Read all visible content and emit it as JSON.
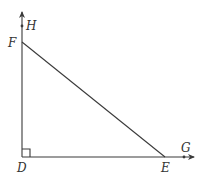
{
  "diagram": {
    "type": "geometry",
    "colors": {
      "line": "#3a3a3a",
      "label": "#333333",
      "background": "#ffffff"
    },
    "points": {
      "D": {
        "label": "D",
        "x": 22,
        "y": 157
      },
      "E": {
        "label": "E",
        "x": 165,
        "y": 157
      },
      "F": {
        "label": "F",
        "x": 22,
        "y": 42
      },
      "G": {
        "label": "G",
        "x": 184,
        "y": 157
      },
      "H": {
        "label": "H",
        "x": 22,
        "y": 26
      }
    },
    "segments": [
      {
        "from": "D",
        "to": "E"
      },
      {
        "from": "D",
        "to": "F"
      },
      {
        "from": "F",
        "to": "E"
      }
    ],
    "rays": [
      {
        "from": "D",
        "through": "H",
        "direction": "up"
      },
      {
        "from": "D",
        "through": "G",
        "direction": "right"
      }
    ],
    "right_angle_marker": {
      "at": "D"
    },
    "labels": {
      "D": "D",
      "E": "E",
      "F": "F",
      "G": "G",
      "H": "H"
    }
  }
}
